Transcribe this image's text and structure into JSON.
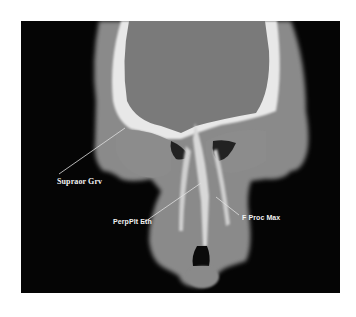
{
  "image": {
    "description": "Coronal CT scan of skull and paranasal region with anatomical labels",
    "labels": [
      {
        "text": "Supraor Grv"
      },
      {
        "text": "PerpPlt Eth"
      },
      {
        "text": "F Proc Max"
      }
    ]
  }
}
